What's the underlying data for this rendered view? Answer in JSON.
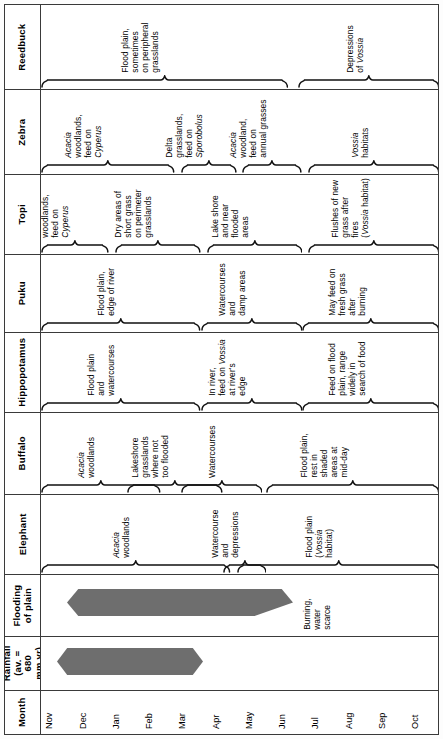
{
  "figure": {
    "type": "seasonal-habitat-use-chart",
    "orientation": "rotated-90-ccw"
  },
  "months": {
    "label": "Month",
    "values": [
      "Nov",
      "Dec",
      "Jan",
      "Feb",
      "Mar",
      "Apr",
      "May",
      "Jun",
      "Jul",
      "Aug",
      "Sep",
      "Oct"
    ]
  },
  "rainfall": {
    "label": "Rainfall\n(av. = 680\nmm yr)",
    "label_line1": "Rainfall",
    "label_line2": "(av. = 680",
    "label_line3": "mm yr)",
    "bar_color": "#6e6e6e",
    "bar_start_month": "Nov",
    "bar_end_month": "Mar"
  },
  "flooding": {
    "label_line1": "Flooding",
    "label_line2": "of plain",
    "bar_color": "#6e6e6e",
    "bar_start_month": "Dec",
    "bar_end_month": "Jun",
    "note": "Burning,\nwater\nscarce"
  },
  "species_rows": [
    {
      "name": "Reedbuck",
      "groups": [
        {
          "label": "Flood plain,\nsometimes\non peripheral\ngrasslands",
          "start": 0.0,
          "end": 0.62
        },
        {
          "label": "Depressions\nof Vossia",
          "italic_words": [
            "Vossia"
          ],
          "start": 0.645,
          "end": 1.0
        }
      ]
    },
    {
      "name": "Zebra",
      "groups": [
        {
          "label": "Acacia\nwoodlands,\nfeed on\nCyperus",
          "italic_words": [
            "Acacia",
            "Cyperus"
          ],
          "start": 0.0,
          "end": 0.335
        },
        {
          "label": "Delta\ngrasslands,\nfeed on\nSporobolus",
          "italic_words": [
            "Sporobolus"
          ],
          "start": 0.35,
          "end": 0.49
        },
        {
          "label": "Acacia\nwoodland,\nfeed on\nannual grasses",
          "italic_words": [
            "Acacia"
          ],
          "start": 0.505,
          "end": 0.655
        },
        {
          "label": "Vossia\nhabitats",
          "italic_words": [
            "Vossia"
          ],
          "start": 0.67,
          "end": 1.0
        }
      ]
    },
    {
      "name": "Topi",
      "groups": [
        {
          "label": "Acacia\nwoodlands,\nfeed on\nCyperus",
          "italic_words": [
            "Acacia",
            "Cyperus"
          ],
          "start": 0.0,
          "end": 0.17
        },
        {
          "label": "Dry areas of\nshort grass\non perimeter\ngrasslands",
          "start": 0.185,
          "end": 0.4
        },
        {
          "label": "Lake shore\nand near\nflooded\nareas",
          "start": 0.415,
          "end": 0.655
        },
        {
          "label": "Flushes of new\ngrass after\nfires\n(Vossia habitat)",
          "italic_words": [
            "Vossia"
          ],
          "start": 0.67,
          "end": 1.0
        }
      ]
    },
    {
      "name": "Puku",
      "groups": [
        {
          "label": "Flood plain,\nedge of river",
          "start": 0.0,
          "end": 0.4
        },
        {
          "label": "Watercourses\nand\ndamp areas",
          "start": 0.4,
          "end": 0.655
        },
        {
          "label": "May feed on\nfresh grass\nafter\nburning",
          "start": 0.655,
          "end": 1.0
        }
      ]
    },
    {
      "name": "Hippopotamus",
      "groups": [
        {
          "label": "Flood plain\nand\nwatercourses",
          "start": 0.0,
          "end": 0.4
        },
        {
          "label": "In river,\nfeed on Vossia\nat river's\nedge",
          "italic_words": [
            "Vossia"
          ],
          "start": 0.4,
          "end": 0.655
        },
        {
          "label": "Feed on flood\nplain, range\nwidely in\nsearch of food",
          "start": 0.655,
          "end": 1.0
        }
      ]
    },
    {
      "name": "Buffalo",
      "groups": [
        {
          "label": "Acacia\nwoodlands",
          "italic_words": [
            "Acacia"
          ],
          "start": 0.0,
          "end": 0.3
        },
        {
          "label": "Lakeshore\ngrasslands\nwhere not\ntoo flooded",
          "start": 0.215,
          "end": 0.455
        },
        {
          "label": "Watercourses",
          "start": 0.35,
          "end": 0.555
        },
        {
          "label": "Flood plain,\nrest in\nshaded\nareas at\nmid-day",
          "start": 0.565,
          "end": 1.0
        }
      ]
    },
    {
      "name": "Elephant",
      "groups": [
        {
          "label": "Acacia\nwoodlands",
          "italic_words": [
            "Acacia"
          ],
          "start": 0.0,
          "end": 0.475
        },
        {
          "label": "Watercourse\nand\ndepressions",
          "start": 0.455,
          "end": 0.565
        },
        {
          "label": "Flood plain\n(Vossia\nhabitat)",
          "italic_words": [
            "Vossia"
          ],
          "start": 0.49,
          "end": 1.0
        }
      ]
    }
  ]
}
